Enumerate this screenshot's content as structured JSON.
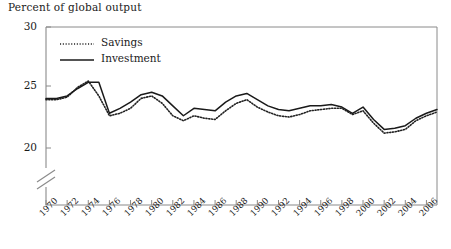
{
  "chart_data": {
    "type": "line",
    "title": "Percent of global output",
    "xlabel": "",
    "ylabel": "Percent of global output",
    "ylim": [
      20,
      30
    ],
    "yticks": [
      20,
      25,
      30
    ],
    "axis_break": true,
    "grid": false,
    "legend_position": "top-left",
    "xlim": [
      1970,
      2007
    ],
    "xticks": [
      1970,
      1972,
      1974,
      1976,
      1978,
      1980,
      1982,
      1984,
      1986,
      1988,
      1990,
      1992,
      1994,
      1996,
      1998,
      2000,
      2002,
      2004,
      2006
    ],
    "xtick_labels": [
      "1970",
      "1972",
      "1974",
      "1976",
      "1978",
      "1980",
      "1982",
      "1984",
      "1986",
      "1988",
      "1990",
      "1992",
      "1994",
      "1996",
      "1998",
      "2000",
      "2002",
      "2004",
      "2006"
    ],
    "x": [
      1970,
      1971,
      1972,
      1973,
      1974,
      1975,
      1976,
      1977,
      1978,
      1979,
      1980,
      1981,
      1982,
      1983,
      1984,
      1985,
      1986,
      1987,
      1988,
      1989,
      1990,
      1991,
      1992,
      1993,
      1994,
      1995,
      1996,
      1997,
      1998,
      1999,
      2000,
      2001,
      2002,
      2003,
      2004,
      2005,
      2006,
      2007
    ],
    "series": [
      {
        "name": "Savings",
        "style": "dotted",
        "color": "#222222",
        "values": [
          23.9,
          23.9,
          24.1,
          24.9,
          25.4,
          24.2,
          22.6,
          22.8,
          23.2,
          24.0,
          24.2,
          23.6,
          22.6,
          22.2,
          22.6,
          22.4,
          22.3,
          23.0,
          23.6,
          23.9,
          23.3,
          22.9,
          22.6,
          22.5,
          22.7,
          23.0,
          23.1,
          23.2,
          23.2,
          22.7,
          23.0,
          22.0,
          21.2,
          21.3,
          21.5,
          22.2,
          22.6,
          22.9
        ]
      },
      {
        "name": "Investment",
        "style": "solid",
        "color": "#1a1a1a",
        "values": [
          24.0,
          24.0,
          24.2,
          24.8,
          25.3,
          25.3,
          22.8,
          23.2,
          23.7,
          24.3,
          24.5,
          24.2,
          23.4,
          22.6,
          23.2,
          23.1,
          23.0,
          23.7,
          24.2,
          24.4,
          23.9,
          23.4,
          23.1,
          23.0,
          23.2,
          23.4,
          23.4,
          23.5,
          23.3,
          22.8,
          23.3,
          22.3,
          21.5,
          21.6,
          21.8,
          22.4,
          22.8,
          23.1
        ]
      }
    ]
  },
  "legend": {
    "items": [
      {
        "label": "Savings",
        "style": "dotted"
      },
      {
        "label": "Investment",
        "style": "solid"
      }
    ]
  }
}
